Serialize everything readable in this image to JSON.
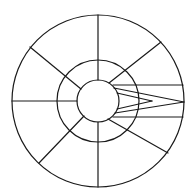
{
  "diagram": {
    "type": "concentric-circle-sector-diagram",
    "stroke_color": "#1a1a1a",
    "background_color": "#ffffff",
    "center": [
      98,
      101
    ],
    "circles": [
      {
        "name": "outer",
        "r": 86
      },
      {
        "name": "middle",
        "r": 41
      },
      {
        "name": "inner",
        "r": 21
      }
    ],
    "radial_lines": [
      {
        "name": "top",
        "x1": 98,
        "y1": 80,
        "x2": 98,
        "y2": 15
      },
      {
        "name": "bottom",
        "x1": 98,
        "y1": 122,
        "x2": 98,
        "y2": 187
      },
      {
        "name": "left",
        "x1": 77,
        "y1": 101,
        "x2": 12,
        "y2": 101
      },
      {
        "name": "top-left",
        "x1": 81,
        "y1": 89,
        "x2": 30,
        "y2": 47
      },
      {
        "name": "top-right",
        "x1": 109,
        "y1": 83,
        "x2": 161,
        "y2": 42
      },
      {
        "name": "bottom-left",
        "x1": 84,
        "y1": 116,
        "x2": 39,
        "y2": 163
      },
      {
        "name": "bottom-right",
        "x1": 108,
        "y1": 119,
        "x2": 168,
        "y2": 153
      }
    ],
    "right_channel_lines": [
      {
        "name": "channel-top",
        "x1": 113,
        "y1": 85,
        "x2": 183,
        "y2": 85
      },
      {
        "name": "channel-bottom",
        "x1": 113,
        "y1": 117,
        "x2": 183,
        "y2": 117
      }
    ],
    "wedge_lines": [
      {
        "name": "outer-wedge-top",
        "x1": 114,
        "y1": 88,
        "x2": 184,
        "y2": 102
      },
      {
        "name": "outer-wedge-bottom",
        "x1": 115,
        "y1": 113,
        "x2": 184,
        "y2": 102
      },
      {
        "name": "inner-wedge-top",
        "x1": 117,
        "y1": 93,
        "x2": 152,
        "y2": 101
      },
      {
        "name": "inner-wedge-bottom",
        "x1": 117,
        "y1": 109,
        "x2": 152,
        "y2": 101
      }
    ]
  }
}
